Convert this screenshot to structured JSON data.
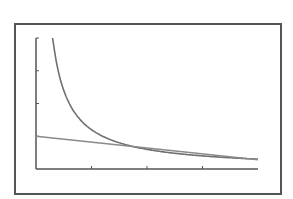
{
  "chart_data": {
    "type": "line",
    "title": "",
    "xlabel": "",
    "ylabel": "",
    "xlim": [
      0,
      4
    ],
    "ylim": [
      0,
      4
    ],
    "x_ticks": [
      1,
      2,
      3
    ],
    "y_ticks": [
      1,
      2,
      3,
      4
    ],
    "tick_labels_visible": false,
    "grid": false,
    "legend": null,
    "series": [
      {
        "name": "hyperbolic curve",
        "x": [
          0.3,
          0.4,
          0.5,
          0.6,
          0.8,
          1.0,
          1.25,
          1.5,
          2.0,
          2.5,
          3.0,
          3.5,
          4.0
        ],
        "values": [
          4.0,
          3.0,
          2.4,
          2.0,
          1.5,
          1.2,
          0.96,
          0.8,
          0.6,
          0.48,
          0.4,
          0.34,
          0.3
        ]
      },
      {
        "name": "straight line",
        "x": [
          0,
          4
        ],
        "values": [
          1.0,
          0.28
        ]
      }
    ]
  },
  "colors": {
    "axis": "#555555",
    "frame": "#555555",
    "curve": "#707070",
    "line": "#8a8a8a",
    "background": "#ffffff"
  },
  "layout": {
    "origin_px": [
      36,
      169
    ],
    "x_unit_px": 55.5,
    "y_unit_px": 32.75
  }
}
